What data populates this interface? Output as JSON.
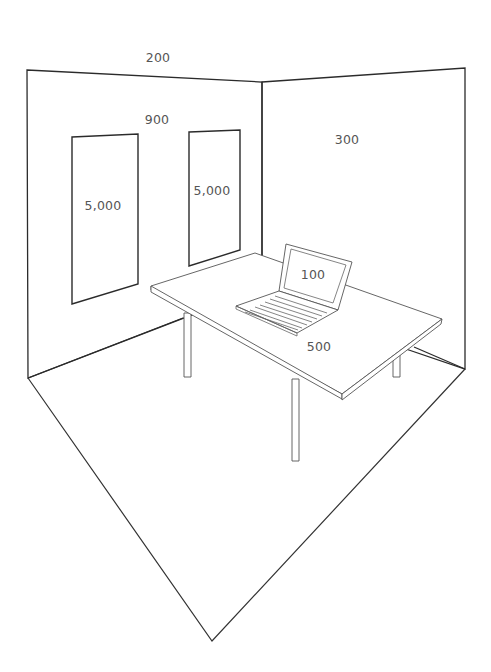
{
  "diagram": {
    "labels": {
      "ceiling": "200",
      "back_wall": "900",
      "window_left": "5,000",
      "window_right": "5,000",
      "right_wall": "300",
      "laptop_screen": "100",
      "desk_surface": "500"
    },
    "colors": {
      "line": "#2b2b2b",
      "furniture_line": "#555555",
      "label_text": "#555555",
      "background": "#ffffff"
    }
  }
}
